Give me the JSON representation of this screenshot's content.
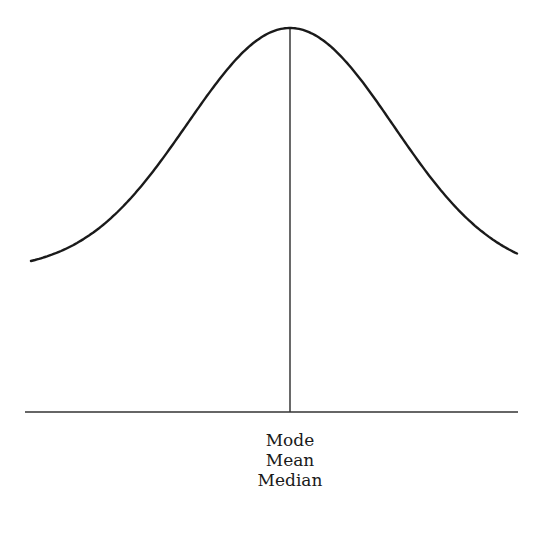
{
  "diagram": {
    "type": "normal-distribution",
    "curve": {
      "start": {
        "x": 31,
        "y": 261
      },
      "peak": {
        "x": 290,
        "y": 28
      },
      "end": {
        "x": 518,
        "y": 254
      },
      "sigma_px": 103,
      "stroke": "#1a1a1a"
    },
    "axis": {
      "x1": 25,
      "x2": 518,
      "y": 412,
      "stroke": "#333333"
    },
    "center_line": {
      "x": 290,
      "y1": 28,
      "y2": 412,
      "stroke": "#1a1a1a"
    },
    "labels": [
      "Mode",
      "Mean",
      "Median"
    ]
  }
}
